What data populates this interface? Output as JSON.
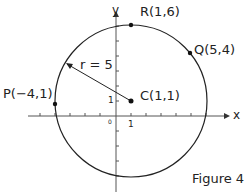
{
  "figure": {
    "caption": "Figure 4",
    "axes": {
      "x_label": "x",
      "y_label": "y",
      "origin_label": "0",
      "x_tick_label": "1",
      "y_tick_label": "1"
    },
    "circle": {
      "center": [
        1,
        1
      ],
      "radius": 5,
      "radius_label": "r = 5"
    },
    "points": [
      {
        "name": "R",
        "label": "R(1,6)",
        "coords": [
          1,
          6
        ]
      },
      {
        "name": "Q",
        "label": "Q(5,4)",
        "coords": [
          5,
          4
        ]
      },
      {
        "name": "P",
        "label": "P(−4,1)",
        "coords": [
          -4,
          1
        ]
      },
      {
        "name": "C",
        "label": "C(1,1)",
        "coords": [
          1,
          1
        ]
      }
    ]
  }
}
